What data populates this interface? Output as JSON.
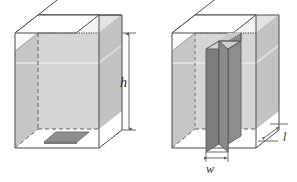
{
  "figure": {
    "type": "technical-illustration",
    "background_color": "#ffffff",
    "panels": [
      {
        "id": "left-tank",
        "name": "tank-with-horizontal-plate",
        "contents": "horizontal rectangular plate resting on the tank floor",
        "dimension_labels": [
          "h"
        ]
      },
      {
        "id": "right-tank",
        "name": "tank-with-vertical-slab",
        "contents": "vertical rectangular slab submerged standing on the tank floor",
        "dimension_labels": [
          "w",
          "l"
        ]
      }
    ],
    "labels": {
      "height": "h",
      "width": "w",
      "length": "l"
    },
    "colors": {
      "liquid_front_face": "#d3d3d3",
      "liquid_side_face": "#bfbfbf",
      "liquid_surface": "#e2e2e2",
      "wall_outline": "#4a4a4a",
      "hidden_edge": "#6e6e6e",
      "plate_top": "#8f8f8f",
      "slab_front": "#9a9a9a",
      "slab_side": "#7d7d7d",
      "dimension_line": "#5a5a5a",
      "label_text": "#2b2b2b"
    }
  }
}
